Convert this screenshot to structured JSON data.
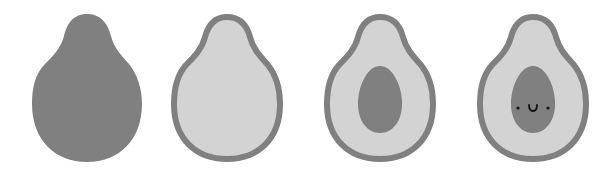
{
  "figure": {
    "steps": [
      {
        "label": "step-1-silhouette",
        "offset_x": 17
      },
      {
        "label": "step-2-outline",
        "offset_x": 157
      },
      {
        "label": "step-3-pit",
        "offset_x": 310
      },
      {
        "label": "step-4-face",
        "offset_x": 463
      }
    ]
  },
  "colors": {
    "background": "#ffffff",
    "dark_gray": "#808080",
    "light_gray": "#d3d3d3",
    "face": "#111111"
  }
}
